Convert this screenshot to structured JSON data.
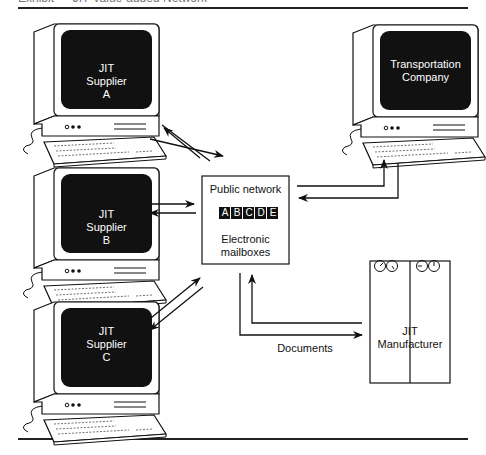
{
  "figure": {
    "caption": "Exhibit — JIT Value-added Network",
    "nodes": {
      "supplier_a": {
        "line1": "JIT",
        "line2": "Supplier",
        "line3": "A"
      },
      "supplier_b": {
        "line1": "JIT",
        "line2": "Supplier",
        "line3": "B"
      },
      "supplier_c": {
        "line1": "JIT",
        "line2": "Supplier",
        "line3": "C"
      },
      "transport": {
        "line1": "Transportation",
        "line2": "Company"
      },
      "network": {
        "title": "Public network",
        "mailboxes": [
          "A",
          "B",
          "C",
          "D",
          "E"
        ],
        "line1": "Electronic",
        "line2": "mailboxes"
      },
      "manufacturer": {
        "line1": "JIT",
        "line2": "Manufacturer"
      }
    },
    "edge_label": "Documents"
  }
}
